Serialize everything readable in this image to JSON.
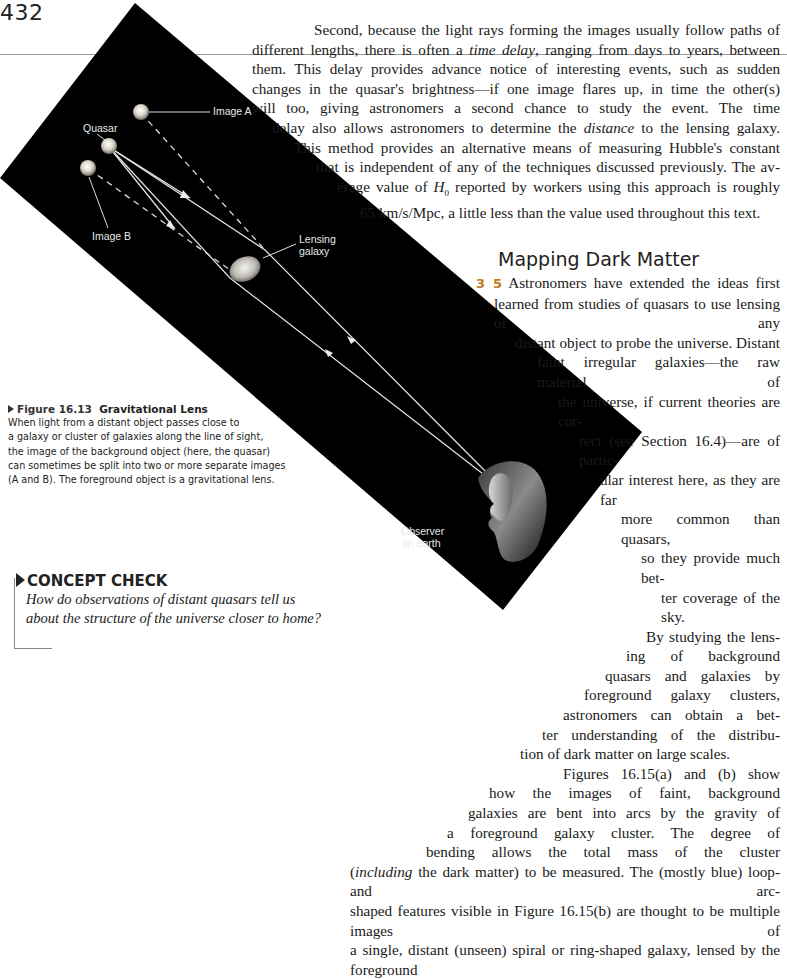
{
  "page": {
    "number": "432"
  },
  "figure": {
    "labels": {
      "image_a": "Image A",
      "quasar": "Quasar",
      "image_b": "Image B",
      "lensing_galaxy_1": "Lensing",
      "lensing_galaxy_2": "galaxy",
      "observer_1": "Observer",
      "observer_2": "on earth"
    },
    "caption": {
      "figure_number": "Figure 16.13",
      "title": "Gravitational Lens",
      "lines": [
        "When light from a distant object passes close to",
        "a galaxy or cluster of galaxies along the line of sight,",
        "the image of the background object (here, the quasar)",
        "can sometimes be split into two or more separate images",
        "(A and B). The foreground object is a gravitational lens."
      ]
    },
    "colors": {
      "background": "#000000",
      "rays": "#e6e6e6"
    }
  },
  "paragraph1": {
    "lines": [
      "Second, because the light rays forming the images usually follow paths of",
      "different lengths, there is often a time delay, ranging from days to years, between",
      "them. This delay provides advance notice of interesting events, such as sudden",
      "changes in the quasar's brightness—if one image flares up, in time the other(s)",
      "will too, giving astronomers a second chance to study the event. The time",
      "delay also allows astronomers to determine the distance to the lensing galaxy.",
      "This method provides an alternative means of measuring Hubble's constant",
      "that is independent of any of the techniques discussed previously. The av-",
      "erage value of H0 reported by workers using this approach is roughly",
      "65 km/s/Mpc, a little less than the value used throughout this text."
    ]
  },
  "section": {
    "heading": "Mapping Dark Matter",
    "marker": "3 5",
    "lines": [
      "Astronomers have extended the ideas first",
      "learned from studies of quasars to use lensing of any",
      "distant object to probe the universe. Distant",
      "faint irregular galaxies—the raw material of",
      "the universe, if current theories are cor-",
      "rect (see Section 16.4)—are of partic-",
      "ular interest here, as they are far",
      "more common than quasars,",
      "so they provide much bet-",
      "ter coverage of the sky.",
      "By studying the lens-",
      "ing of background",
      "quasars and galaxies by",
      "foreground galaxy clusters,",
      "astronomers can obtain a bet-",
      "ter understanding of the distribu-",
      "tion of dark matter on large scales.",
      "Figures 16.15(a) and (b) show",
      "how the images of faint, background",
      "galaxies are bent into arcs by the gravity of",
      "a foreground galaxy cluster. The degree of",
      "bending allows the total mass of the cluster",
      "(including the dark matter) to be measured. The (mostly blue) loop- and arc-",
      "shaped features visible in Figure 16.15(b) are thought to be multiple images of",
      "a single, distant (unseen) spiral or ring-shaped galaxy, lensed by the foreground"
    ]
  },
  "concept_check": {
    "heading": "CONCEPT CHECK",
    "question_line1": "How do observations of distant quasars tell us",
    "question_line2": "about the structure of the universe closer to home?"
  }
}
